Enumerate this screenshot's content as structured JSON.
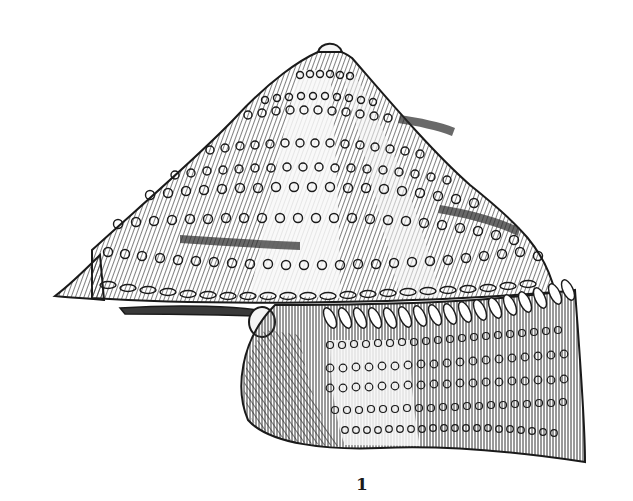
{
  "figure": {
    "caption": "1",
    "colors": {
      "background": "#ffffff",
      "ink": "#1a1a1a",
      "shade": "#3a3a3a",
      "mid": "#6e6e6e",
      "highlight": "#f4f4f4"
    }
  }
}
